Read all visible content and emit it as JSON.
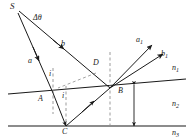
{
  "figure": {
    "type": "optics-ray-diagram",
    "width": 193,
    "height": 140,
    "background_color": "#ffffff",
    "line_color": "#1a1a1a",
    "dash_color": "#8a8a8a"
  },
  "points": {
    "source": {
      "label": "S",
      "x": 13,
      "y": 8
    },
    "A": {
      "label": "A",
      "x": 42,
      "y": 97
    },
    "C": {
      "label": "C",
      "x": 66,
      "y": 131
    },
    "D": {
      "label": "D",
      "x": 97,
      "y": 66
    }
  },
  "rays": {
    "incident_lower": {
      "label": "a"
    },
    "incident_upper": {
      "label": "b"
    },
    "outgoing_upper": {
      "label": "a",
      "sub": "1"
    },
    "outgoing_lower": {
      "label": "b",
      "sub": "1"
    }
  },
  "angles": {
    "divergence": {
      "label": "Δθ",
      "x": 37,
      "y": 19
    },
    "incidence_at_A": {
      "label": "i",
      "x": 52,
      "y": 73
    },
    "refraction_at_A": {
      "label": "i",
      "x": 65,
      "y": 93
    }
  },
  "media": {
    "upper": {
      "label": "n",
      "sub": "1"
    },
    "film": {
      "label": "n",
      "sub": "2"
    },
    "lower": {
      "label": "n",
      "sub": "3"
    }
  },
  "thickness": {
    "label": "B",
    "x": 122,
    "y": 92
  }
}
